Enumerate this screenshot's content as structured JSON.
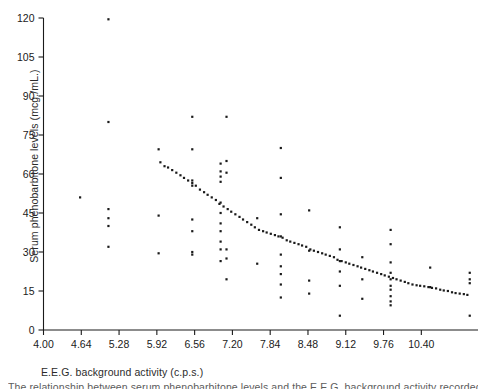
{
  "figure": {
    "background": "#ffffff",
    "ink": "#1a1a1a",
    "xlabel": "E.E.G. background activity (c.p.s.)",
    "ylabel": "Serum phenobarbitone levels (mcg./mL.)",
    "footnote": "The relationship between serum phenobarbitone levels and the E.E.G. background activity recorded in the"
  },
  "chart_data": {
    "type": "scatter",
    "title": "",
    "xlabel": "E.E.G. background activity (c.p.s.)",
    "ylabel": "Serum phenobarbitone levels (mcg./mL.)",
    "xlim": [
      4.0,
      11.36
    ],
    "ylim": [
      0,
      120
    ],
    "xticks": [
      4.0,
      4.64,
      5.28,
      5.92,
      6.56,
      7.2,
      7.84,
      8.48,
      9.12,
      9.76,
      10.4
    ],
    "xticklabels": [
      "4.00",
      "4.64",
      "5.28",
      "5.92",
      "6.56",
      "7.20",
      "7.84",
      "8.48",
      "9.12",
      "9.76",
      "10.40"
    ],
    "yticks": [
      0,
      15,
      30,
      45,
      60,
      75,
      90,
      105,
      120
    ],
    "yticklabels": [
      "0",
      "15",
      "30",
      "45",
      "60",
      "75",
      "90",
      "105",
      "120"
    ],
    "grid": false,
    "legend": null,
    "marker": "dot",
    "marker_size": 2.0,
    "marker_color": "#1a1a1a",
    "series": [
      {
        "name": "observations",
        "points": [
          [
            4.62,
            51.0
          ],
          [
            5.1,
            119.5
          ],
          [
            5.1,
            80.0
          ],
          [
            5.1,
            46.5
          ],
          [
            5.1,
            43.0
          ],
          [
            5.1,
            40.0
          ],
          [
            5.1,
            32.0
          ],
          [
            5.95,
            69.5
          ],
          [
            5.95,
            44.0
          ],
          [
            5.95,
            29.5
          ],
          [
            6.52,
            82.0
          ],
          [
            6.52,
            69.5
          ],
          [
            6.52,
            57.5
          ],
          [
            6.52,
            55.5
          ],
          [
            6.52,
            42.5
          ],
          [
            6.52,
            38.0
          ],
          [
            6.52,
            30.0
          ],
          [
            6.52,
            29.0
          ],
          [
            7.0,
            64.0
          ],
          [
            7.0,
            61.0
          ],
          [
            7.0,
            59.0
          ],
          [
            7.0,
            57.0
          ],
          [
            7.0,
            49.0
          ],
          [
            7.0,
            45.0
          ],
          [
            7.0,
            41.0
          ],
          [
            7.0,
            38.0
          ],
          [
            7.0,
            34.0
          ],
          [
            7.0,
            31.0
          ],
          [
            7.0,
            26.5
          ],
          [
            7.1,
            82.0
          ],
          [
            7.1,
            65.0
          ],
          [
            7.1,
            60.5
          ],
          [
            7.1,
            31.0
          ],
          [
            7.1,
            27.5
          ],
          [
            7.1,
            19.5
          ],
          [
            7.62,
            43.0
          ],
          [
            7.62,
            25.5
          ],
          [
            8.02,
            70.0
          ],
          [
            8.02,
            58.5
          ],
          [
            8.02,
            44.5
          ],
          [
            8.02,
            36.0
          ],
          [
            8.02,
            29.0
          ],
          [
            8.02,
            24.5
          ],
          [
            8.02,
            21.5
          ],
          [
            8.02,
            17.5
          ],
          [
            8.02,
            12.5
          ],
          [
            8.5,
            46.0
          ],
          [
            8.5,
            30.5
          ],
          [
            8.5,
            19.0
          ],
          [
            8.5,
            14.0
          ],
          [
            9.02,
            39.5
          ],
          [
            9.02,
            31.0
          ],
          [
            9.02,
            26.5
          ],
          [
            9.02,
            22.5
          ],
          [
            9.02,
            17.0
          ],
          [
            9.02,
            5.5
          ],
          [
            9.4,
            28.0
          ],
          [
            9.4,
            19.5
          ],
          [
            9.4,
            12.0
          ],
          [
            9.88,
            38.5
          ],
          [
            9.88,
            33.0
          ],
          [
            9.88,
            26.0
          ],
          [
            9.88,
            22.0
          ],
          [
            9.88,
            19.5
          ],
          [
            9.88,
            17.0
          ],
          [
            9.88,
            15.5
          ],
          [
            9.88,
            13.0
          ],
          [
            9.88,
            11.0
          ],
          [
            9.88,
            9.5
          ],
          [
            10.55,
            24.0
          ],
          [
            10.55,
            16.5
          ],
          [
            11.22,
            22.0
          ],
          [
            11.22,
            19.5
          ],
          [
            11.22,
            18.0
          ],
          [
            11.22,
            5.5
          ]
        ]
      },
      {
        "name": "fitted-trend",
        "points": [
          [
            5.98,
            64.5
          ],
          [
            6.05,
            63.0
          ],
          [
            6.11,
            62.5
          ],
          [
            6.18,
            61.5
          ],
          [
            6.25,
            60.5
          ],
          [
            6.32,
            59.5
          ],
          [
            6.38,
            58.5
          ],
          [
            6.45,
            57.5
          ],
          [
            6.52,
            56.5
          ],
          [
            6.58,
            55.5
          ],
          [
            6.65,
            54.0
          ],
          [
            6.72,
            53.0
          ],
          [
            6.78,
            52.0
          ],
          [
            6.85,
            51.0
          ],
          [
            6.92,
            50.0
          ],
          [
            6.98,
            48.5
          ],
          [
            7.05,
            47.5
          ],
          [
            7.12,
            46.5
          ],
          [
            7.18,
            45.5
          ],
          [
            7.25,
            44.5
          ],
          [
            7.32,
            43.5
          ],
          [
            7.38,
            42.5
          ],
          [
            7.45,
            41.5
          ],
          [
            7.52,
            40.5
          ],
          [
            7.58,
            39.5
          ],
          [
            7.65,
            38.5
          ],
          [
            7.72,
            38.0
          ],
          [
            7.78,
            37.5
          ],
          [
            7.85,
            37.0
          ],
          [
            7.92,
            36.5
          ],
          [
            7.98,
            36.0
          ],
          [
            8.05,
            35.5
          ],
          [
            8.12,
            34.5
          ],
          [
            8.18,
            34.0
          ],
          [
            8.25,
            33.5
          ],
          [
            8.32,
            33.0
          ],
          [
            8.38,
            32.5
          ],
          [
            8.45,
            32.0
          ],
          [
            8.52,
            31.0
          ],
          [
            8.58,
            30.5
          ],
          [
            8.65,
            30.0
          ],
          [
            8.72,
            29.5
          ],
          [
            8.78,
            29.0
          ],
          [
            8.85,
            28.5
          ],
          [
            8.92,
            28.0
          ],
          [
            8.98,
            27.0
          ],
          [
            9.05,
            26.5
          ],
          [
            9.12,
            26.0
          ],
          [
            9.18,
            25.5
          ],
          [
            9.25,
            25.0
          ],
          [
            9.32,
            24.5
          ],
          [
            9.38,
            24.0
          ],
          [
            9.45,
            23.5
          ],
          [
            9.52,
            23.0
          ],
          [
            9.58,
            22.5
          ],
          [
            9.65,
            22.0
          ],
          [
            9.72,
            21.5
          ],
          [
            9.78,
            21.0
          ],
          [
            9.85,
            20.5
          ],
          [
            9.92,
            20.0
          ],
          [
            9.98,
            19.5
          ],
          [
            10.05,
            19.0
          ],
          [
            10.12,
            18.5
          ],
          [
            10.18,
            18.0
          ],
          [
            10.25,
            17.5
          ],
          [
            10.32,
            17.2
          ],
          [
            10.38,
            17.0
          ],
          [
            10.45,
            16.8
          ],
          [
            10.52,
            16.5
          ],
          [
            10.58,
            16.2
          ],
          [
            10.65,
            16.0
          ],
          [
            10.72,
            15.5
          ],
          [
            10.78,
            15.2
          ],
          [
            10.85,
            15.0
          ],
          [
            10.92,
            14.5
          ],
          [
            10.98,
            14.2
          ],
          [
            11.05,
            14.0
          ],
          [
            11.12,
            13.8
          ],
          [
            11.18,
            13.5
          ]
        ]
      }
    ]
  }
}
